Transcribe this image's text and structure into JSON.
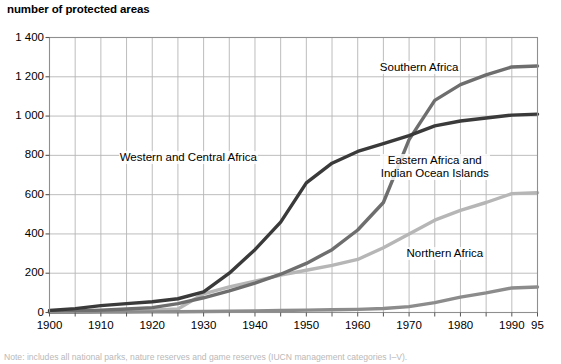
{
  "chart_data": {
    "type": "line",
    "title": "number of protected areas",
    "xlabel": "",
    "ylabel": "number of protected areas",
    "xlim": [
      1900,
      1995
    ],
    "ylim": [
      0,
      1400
    ],
    "grid": true,
    "grid_x_step": 5,
    "grid_y_step": 200,
    "legend_position": "inline-annotations",
    "x_tick_labels": [
      "1900",
      "1910",
      "1920",
      "1930",
      "1940",
      "1950",
      "1960",
      "1970",
      "1980",
      "1990",
      "95"
    ],
    "x_tick_values": [
      1900,
      1910,
      1920,
      1930,
      1940,
      1950,
      1960,
      1970,
      1980,
      1990,
      1995
    ],
    "y_tick_labels": [
      "0",
      "200",
      "400",
      "600",
      "800",
      "1 000",
      "1 200",
      "1 400"
    ],
    "y_tick_values": [
      0,
      200,
      400,
      600,
      800,
      1000,
      1200,
      1400
    ],
    "x": [
      1900,
      1905,
      1910,
      1915,
      1920,
      1925,
      1930,
      1935,
      1940,
      1945,
      1950,
      1955,
      1960,
      1965,
      1970,
      1975,
      1980,
      1985,
      1990,
      1995
    ],
    "series": [
      {
        "name": "Southern Africa",
        "color": "#6e6e6e",
        "values": [
          5,
          8,
          12,
          18,
          25,
          45,
          75,
          110,
          150,
          195,
          250,
          320,
          420,
          560,
          880,
          1080,
          1160,
          1210,
          1250,
          1255
        ],
        "label_x": 1972,
        "label_y": 1245
      },
      {
        "name": "Western and Central Africa",
        "color": "#3a3a3a",
        "values": [
          10,
          20,
          35,
          45,
          55,
          70,
          105,
          200,
          320,
          460,
          660,
          760,
          820,
          860,
          900,
          950,
          975,
          990,
          1005,
          1010
        ],
        "label_x": 1927,
        "label_y": 790
      },
      {
        "name": "Eastern Africa and Indian Ocean Islands",
        "color": "#b6b6b6",
        "values": [
          2,
          3,
          5,
          8,
          12,
          18,
          95,
          130,
          160,
          190,
          215,
          240,
          270,
          330,
          400,
          470,
          520,
          560,
          605,
          610
        ],
        "label_x": 1975,
        "label_y": 740
      },
      {
        "name": "Northern Africa",
        "color": "#8c8c8c",
        "values": [
          1,
          1,
          2,
          2,
          3,
          4,
          5,
          6,
          8,
          10,
          12,
          14,
          16,
          20,
          30,
          50,
          78,
          100,
          125,
          130
        ],
        "label_x": 1977,
        "label_y": 300
      }
    ]
  },
  "footnote": {
    "text": "Note: includes all national parks, nature reserves and game reserves (IUCN management categories I–V)."
  }
}
